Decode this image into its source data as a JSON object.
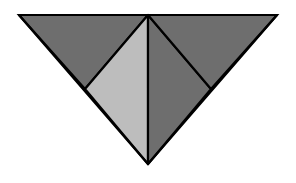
{
  "figure": {
    "background": "#ffffff",
    "stroke": "#000000",
    "stroke_width": 2.2,
    "colors": {
      "dark": "#6e6e6e",
      "light": "#bdbdbd"
    },
    "vertices": {
      "top_left": [
        19,
        15
      ],
      "apex_top": [
        148,
        15
      ],
      "top_right": [
        277,
        15
      ],
      "bottom": [
        148,
        164
      ],
      "left_mid": [
        85,
        89
      ],
      "right_mid": [
        211,
        89
      ]
    },
    "regions": [
      {
        "name": "top-left-triangle",
        "shade": "dark",
        "points": [
          "top_left",
          "apex_top",
          "left_mid"
        ]
      },
      {
        "name": "center-left-triangle",
        "shade": "light",
        "points": [
          "apex_top",
          "left_mid",
          "bottom"
        ]
      },
      {
        "name": "center-right-triangle",
        "shade": "dark",
        "points": [
          "apex_top",
          "bottom",
          "right_mid"
        ]
      },
      {
        "name": "top-right-triangle",
        "shade": "dark",
        "points": [
          "apex_top",
          "top_right",
          "right_mid"
        ]
      }
    ]
  }
}
